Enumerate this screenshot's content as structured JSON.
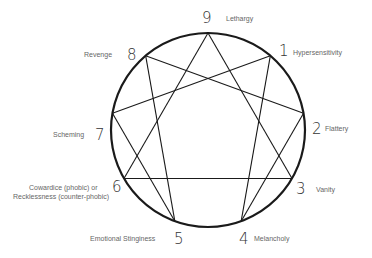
{
  "diagram": {
    "type": "enneagram",
    "points": [
      {
        "number": "9",
        "label": "Lethargy"
      },
      {
        "number": "1",
        "label": "Hypersensitivity"
      },
      {
        "number": "2",
        "label": "Flattery"
      },
      {
        "number": "3",
        "label": "Vanity"
      },
      {
        "number": "4",
        "label": "Melancholy"
      },
      {
        "number": "5",
        "label": "Emotional Stinginess"
      },
      {
        "number": "6",
        "label_line1": "Cowardice (phobic) or",
        "label_line2": "Recklessness (counter-phobic)"
      },
      {
        "number": "7",
        "label": "Scheming"
      },
      {
        "number": "8",
        "label": "Revenge"
      }
    ],
    "triangle": [
      "9",
      "3",
      "6"
    ],
    "hexad": [
      "1",
      "4",
      "2",
      "8",
      "5",
      "7"
    ],
    "colors": {
      "line": "#1a1a1a",
      "number": "#333333",
      "label": "#666666"
    }
  }
}
